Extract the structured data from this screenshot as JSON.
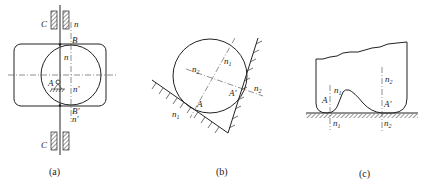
{
  "figure": {
    "panels": [
      {
        "id": "a",
        "caption": "(a)",
        "labels": {
          "guide_top": "C",
          "guide_bottom": "C",
          "normal_top": "n",
          "point_top": "B",
          "normal_mid": "n",
          "pivot": "A",
          "normal_mid_prime": "n'",
          "point_bottom": "B'",
          "normal_bottom_prime": "n'"
        }
      },
      {
        "id": "b",
        "caption": "(b)",
        "labels": {
          "n2_left": "n",
          "n2_left_sub": "2",
          "n1_top": "n",
          "n1_top_sub": "1",
          "point_a": "A",
          "point_a_prime": "A'",
          "n2_right": "n",
          "n2_right_sub": "2",
          "n1_bottom": "n",
          "n1_bottom_sub": "1"
        }
      },
      {
        "id": "c",
        "caption": "(c)",
        "labels": {
          "n1_top": "n",
          "n1_top_sub": "1",
          "point_a": "A",
          "n1_bottom": "n",
          "n1_bottom_sub": "1",
          "n2_top": "n",
          "n2_top_sub": "2",
          "point_a_prime": "A'",
          "n2_bottom": "n",
          "n2_bottom_sub": "2"
        }
      }
    ]
  }
}
